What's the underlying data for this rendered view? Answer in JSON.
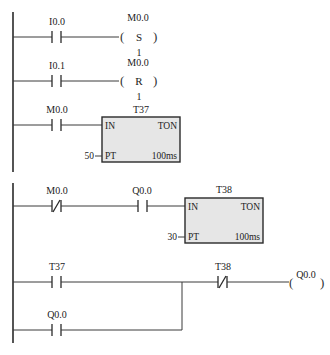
{
  "diagram": {
    "type": "ladder",
    "rungs": [
      {
        "id": 1,
        "contact": {
          "label": "I0.0",
          "type": "NO"
        },
        "coil": {
          "label": "M0.0",
          "instruction": "S",
          "count": "1"
        }
      },
      {
        "id": 2,
        "contact": {
          "label": "I0.1",
          "type": "NO"
        },
        "coil": {
          "label": "M0.0",
          "instruction": "R",
          "count": "1"
        }
      },
      {
        "id": 3,
        "contact": {
          "label": "M0.0",
          "type": "NO"
        },
        "timer": {
          "name": "T37",
          "in": "IN",
          "type": "TON",
          "pt_label": "PT",
          "preset": "50",
          "base": "100ms"
        }
      },
      {
        "id": 4,
        "contacts": [
          {
            "label": "M0.0",
            "type": "NC"
          },
          {
            "label": "Q0.0",
            "type": "NO"
          }
        ],
        "timer": {
          "name": "T38",
          "in": "IN",
          "type": "TON",
          "pt_label": "PT",
          "preset": "30",
          "base": "100ms"
        }
      },
      {
        "id": 5,
        "contact": {
          "label": "T37",
          "type": "NO"
        },
        "branch_contact": {
          "label": "Q0.0",
          "type": "NO"
        },
        "series_contact": {
          "label": "T38",
          "type": "NC"
        },
        "coil": {
          "label": "Q0.0"
        }
      }
    ]
  },
  "text": {
    "r1_contact": "I0.0",
    "r1_coil_label": "M0.0",
    "r1_coil_instr": "S",
    "r1_coil_count": "1",
    "r2_contact": "I0.1",
    "r2_coil_label": "M0.0",
    "r2_coil_instr": "R",
    "r2_coil_count": "1",
    "r3_contact": "M0.0",
    "r3_timer_name": "T37",
    "r3_in": "IN",
    "r3_type": "TON",
    "r3_pt": "PT",
    "r3_preset": "50",
    "r3_base": "100ms",
    "r4_contact1": "M0.0",
    "r4_contact2": "Q0.0",
    "r4_timer_name": "T38",
    "r4_in": "IN",
    "r4_type": "TON",
    "r4_pt": "PT",
    "r4_preset": "30",
    "r4_base": "100ms",
    "r5_contact": "T37",
    "r5_branch": "Q0.0",
    "r5_nc": "T38",
    "r5_coil": "Q0.0",
    "paren_open": "(",
    "paren_close": ")"
  }
}
